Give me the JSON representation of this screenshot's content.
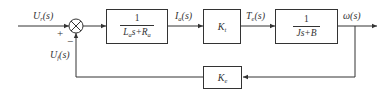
{
  "diagram": {
    "type": "control-system-block-diagram",
    "input_label": {
      "base": "U",
      "sub": "r",
      "arg": "(s)"
    },
    "feedback_label": {
      "base": "U",
      "sub": "f",
      "arg": "(s)"
    },
    "summing_junction": {
      "plus": "+",
      "minus": "−"
    },
    "blocks": {
      "armature": {
        "numerator": "1",
        "den_L": "L",
        "den_L_sub": "a",
        "den_mid": "s+",
        "den_R": "R",
        "den_R_sub": "a"
      },
      "torque_gain": {
        "base": "K",
        "sub": "t"
      },
      "mechanical": {
        "numerator": "1",
        "denominator": "Js+B"
      },
      "feedback_gain": {
        "base": "K",
        "sub": "e"
      }
    },
    "signals": {
      "current": {
        "base": "I",
        "sub": "a",
        "arg": "(s)"
      },
      "torque": {
        "base": "T",
        "sub": "e",
        "arg": "(s)"
      },
      "output": {
        "text": "ω(s)"
      }
    }
  }
}
